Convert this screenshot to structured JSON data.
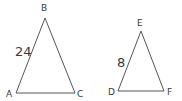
{
  "figures": [
    {
      "name": "triangle ABC",
      "vertices": {
        "A": "A",
        "B": "B",
        "C": "C"
      },
      "side_label": "24",
      "side": "AB"
    },
    {
      "name": "triangle DEF",
      "vertices": {
        "D": "D",
        "E": "E",
        "F": "F"
      },
      "side_label": "8",
      "side": "DE"
    }
  ],
  "colors": {
    "stroke": "#555555",
    "text": "#3a3a3a",
    "background": "#ffffff"
  }
}
